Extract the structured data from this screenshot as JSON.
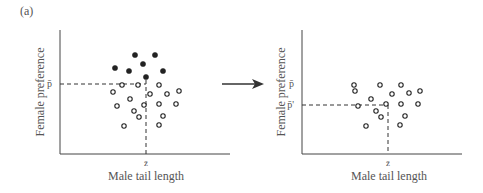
{
  "panel_label": "(a)",
  "left": {
    "ylabel": "Female preference",
    "xlabel": "Male tail length",
    "p_label": "p̄",
    "z_label": "z̄",
    "filled": [
      [
        135,
        55
      ],
      [
        155,
        55
      ],
      [
        143,
        64
      ],
      [
        115,
        68
      ],
      [
        129,
        71
      ],
      [
        163,
        71
      ],
      [
        146,
        77
      ]
    ],
    "open": [
      [
        122,
        85
      ],
      [
        138,
        85
      ],
      [
        159,
        85
      ],
      [
        113,
        92
      ],
      [
        150,
        94
      ],
      [
        167,
        94
      ],
      [
        179,
        91
      ],
      [
        130,
        99
      ],
      [
        117,
        106
      ],
      [
        144,
        105
      ],
      [
        159,
        104
      ],
      [
        176,
        104
      ],
      [
        134,
        111
      ],
      [
        163,
        116
      ],
      [
        139,
        117
      ],
      [
        124,
        126
      ],
      [
        159,
        125
      ]
    ]
  },
  "right": {
    "ylabel": "Female preference",
    "xlabel": "Male tail length",
    "p_label": "p̄",
    "p_prime_label": "p̄'",
    "z_label": "z̄",
    "open": [
      [
        354,
        85
      ],
      [
        380,
        85
      ],
      [
        401,
        85
      ],
      [
        355,
        91
      ],
      [
        392,
        94
      ],
      [
        409,
        93
      ],
      [
        420,
        91
      ],
      [
        371,
        99
      ],
      [
        358,
        106
      ],
      [
        386,
        104
      ],
      [
        401,
        104
      ],
      [
        418,
        104
      ],
      [
        376,
        111
      ],
      [
        405,
        116
      ],
      [
        381,
        117
      ],
      [
        366,
        126
      ],
      [
        400,
        125
      ]
    ]
  },
  "arrow": "arrow-right"
}
